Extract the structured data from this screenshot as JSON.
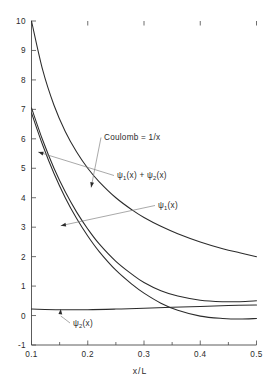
{
  "chart_data": {
    "type": "line",
    "title": "",
    "xlabel": "x/L",
    "ylabel": "",
    "xlim": [
      0.1,
      0.5
    ],
    "ylim": [
      -1,
      10
    ],
    "grid": false,
    "legend_position": "inline-annotations",
    "x_ticks": [
      "0.1",
      "0.2",
      "0.3",
      "0.4",
      "0.5"
    ],
    "x_tick_values": [
      0.1,
      0.2,
      0.3,
      0.4,
      0.5
    ],
    "x_minor_ticks": [
      0.15,
      0.25,
      0.35,
      0.45
    ],
    "y_ticks": [
      "-1",
      "0",
      "1",
      "2",
      "3",
      "4",
      "5",
      "6",
      "7",
      "8",
      "9",
      "10"
    ],
    "y_tick_values": [
      -1,
      0,
      1,
      2,
      3,
      4,
      5,
      6,
      7,
      8,
      9,
      10
    ],
    "series": [
      {
        "name": "Coulomb = 1/x",
        "label_plain": "Coulomb = 1/x",
        "x": [
          0.1,
          0.12,
          0.14,
          0.16,
          0.18,
          0.2,
          0.22,
          0.25,
          0.28,
          0.3,
          0.33,
          0.36,
          0.4,
          0.44,
          0.47,
          0.5
        ],
        "values": [
          10.0,
          8.33,
          7.14,
          6.25,
          5.56,
          5.0,
          4.55,
          4.0,
          3.57,
          3.33,
          3.03,
          2.78,
          2.5,
          2.27,
          2.13,
          2.0
        ]
      },
      {
        "name": "psi1(x) + psi2(x)",
        "label_plain": "ψ₁(x) + ψ₂(x)",
        "x": [
          0.1,
          0.12,
          0.14,
          0.16,
          0.18,
          0.2,
          0.22,
          0.25,
          0.28,
          0.3,
          0.33,
          0.36,
          0.4,
          0.44,
          0.47,
          0.5
        ],
        "values": [
          7.05,
          5.95,
          5.0,
          4.2,
          3.52,
          2.94,
          2.44,
          1.84,
          1.38,
          1.12,
          0.84,
          0.66,
          0.52,
          0.47,
          0.47,
          0.5
        ]
      },
      {
        "name": "psi1(x)",
        "label_plain": "ψ₁(x)",
        "x": [
          0.1,
          0.12,
          0.14,
          0.16,
          0.18,
          0.2,
          0.22,
          0.25,
          0.28,
          0.3,
          0.33,
          0.36,
          0.4,
          0.44,
          0.47,
          0.5
        ],
        "values": [
          6.88,
          5.78,
          4.82,
          4.0,
          3.3,
          2.7,
          2.18,
          1.54,
          1.04,
          0.76,
          0.42,
          0.18,
          -0.02,
          -0.1,
          -0.12,
          -0.1
        ]
      },
      {
        "name": "psi2(x)",
        "label_plain": "ψ₂(x)",
        "x": [
          0.1,
          0.15,
          0.2,
          0.25,
          0.3,
          0.35,
          0.4,
          0.45,
          0.5
        ],
        "values": [
          0.22,
          0.2,
          0.2,
          0.22,
          0.25,
          0.28,
          0.31,
          0.34,
          0.36
        ]
      }
    ],
    "annotations": [
      {
        "id": "coulomb",
        "text_main": "Coulomb = 1/x",
        "text_sub": "",
        "target_x": 0.206,
        "target_y": 4.35
      },
      {
        "id": "sum",
        "text_pre": "ψ",
        "text_sub1": "1",
        "text_mid": "(x) + ψ",
        "text_sub2": "2",
        "text_post": "(x)",
        "target_x": 0.112,
        "target_y": 5.55
      },
      {
        "id": "psi1",
        "text_pre": "ψ",
        "text_sub1": "1",
        "text_post": "(x)",
        "target_x": 0.152,
        "target_y": 3.05
      },
      {
        "id": "psi2",
        "text_pre": "ψ",
        "text_sub1": "2",
        "text_post": "(x)",
        "target_x": 0.152,
        "target_y": 0.22
      }
    ],
    "colors": {
      "curve": "#2b2b2b",
      "axis": "#4a4a4a",
      "leader": "#7a7a7a",
      "background": "#ffffff"
    }
  }
}
